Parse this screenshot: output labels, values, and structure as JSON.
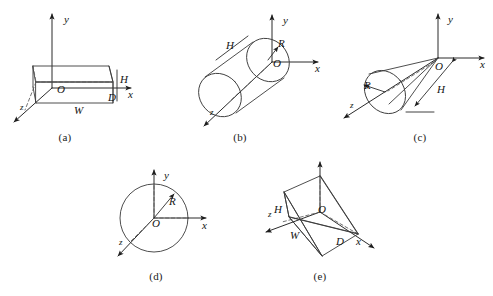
{
  "figure": {
    "background_color": "#ffffff",
    "line_color": "#3a3a3a",
    "axis_color": "#2b2b2b",
    "label_color": "#141414"
  },
  "axis_labels": {
    "x": "x",
    "y": "y",
    "z": "z",
    "origin": "O"
  },
  "panels": [
    {
      "id": "a",
      "caption": "(a)",
      "shape": "rectangular-box",
      "origin_label": "O",
      "axes": [
        "x",
        "y",
        "z"
      ],
      "dimensions": [
        {
          "symbol": "H",
          "meaning": "height"
        },
        {
          "symbol": "W",
          "meaning": "width"
        },
        {
          "symbol": "D",
          "meaning": "depth"
        }
      ]
    },
    {
      "id": "b",
      "caption": "(b)",
      "shape": "cylinder",
      "origin_label": "O",
      "axes": [
        "x",
        "y",
        "z"
      ],
      "dimensions": [
        {
          "symbol": "R",
          "meaning": "radius"
        },
        {
          "symbol": "H",
          "meaning": "height"
        }
      ]
    },
    {
      "id": "c",
      "caption": "(c)",
      "shape": "cone",
      "origin_label": "O",
      "axes": [
        "x",
        "y",
        "z"
      ],
      "dimensions": [
        {
          "symbol": "R",
          "meaning": "radius"
        },
        {
          "symbol": "H",
          "meaning": "height"
        }
      ]
    },
    {
      "id": "d",
      "caption": "(d)",
      "shape": "sphere",
      "origin_label": "O",
      "axes": [
        "x",
        "y",
        "z"
      ],
      "dimensions": [
        {
          "symbol": "R",
          "meaning": "radius"
        }
      ]
    },
    {
      "id": "e",
      "caption": "(e)",
      "shape": "pyramid-wedge",
      "origin_label": "O",
      "axes": [
        "x",
        "y",
        "z"
      ],
      "dimensions": [
        {
          "symbol": "H",
          "meaning": "height"
        },
        {
          "symbol": "W",
          "meaning": "width"
        },
        {
          "symbol": "D",
          "meaning": "depth"
        }
      ]
    }
  ]
}
